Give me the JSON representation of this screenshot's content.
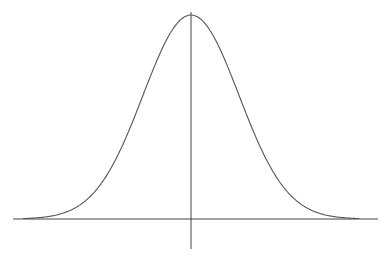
{
  "chart_data": {
    "type": "line",
    "title": "",
    "xlabel": "",
    "ylabel": "",
    "distribution": "normal",
    "mean": 0,
    "std": 1,
    "xlim": [
      -3.5,
      3.5
    ],
    "ylim": [
      0,
      0.4
    ],
    "grid": false,
    "legend": null,
    "series": [
      {
        "name": "normal pdf",
        "x": [
          -3.5,
          -3,
          -2.5,
          -2,
          -1.5,
          -1,
          -0.5,
          0,
          0.5,
          1,
          1.5,
          2,
          2.5,
          3,
          3.5
        ],
        "values": [
          0.0009,
          0.0044,
          0.0175,
          0.054,
          0.1295,
          0.242,
          0.3521,
          0.3989,
          0.3521,
          0.242,
          0.1295,
          0.054,
          0.0175,
          0.0044,
          0.0009
        ]
      }
    ],
    "colors": {
      "curve": "#555555",
      "axes": "#444444",
      "background": "#ffffff"
    }
  },
  "layout": {
    "origin_x": 191,
    "baseline_y": 219,
    "peak_y": 15,
    "px_per_sigma": 48,
    "x_axis": {
      "x1": 13,
      "x2": 378
    },
    "y_axis": {
      "y1": 12,
      "y2": 249
    }
  }
}
